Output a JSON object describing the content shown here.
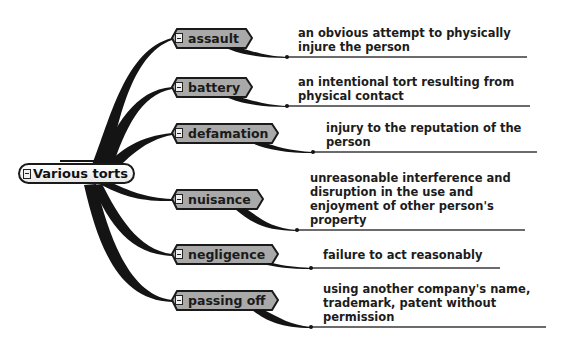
{
  "diagram": {
    "type": "mind-map",
    "root": {
      "label": "Various torts",
      "icon": "collapse-minus-icon"
    },
    "branches": [
      {
        "label": "assault",
        "icon": "collapse-minus-icon",
        "definition": "an obvious attempt to physically injure the person",
        "definition_lines": [
          "an obvious attempt to physically",
          "injure the person"
        ]
      },
      {
        "label": "battery",
        "icon": "collapse-minus-icon",
        "definition": "an intentional tort resulting from physical contact",
        "definition_lines": [
          "an intentional tort resulting from",
          "physical contact"
        ]
      },
      {
        "label": "defamation",
        "icon": "collapse-minus-icon",
        "definition": "injury to the reputation of the person",
        "definition_lines": [
          "injury to the reputation of the",
          "person"
        ]
      },
      {
        "label": "nuisance",
        "icon": "collapse-minus-icon",
        "definition": "unreasonable interference and disruption in the use and enjoyment of other person's property",
        "definition_lines": [
          "unreasonable interference and",
          "disruption in the use and",
          "enjoyment of other person's",
          "property"
        ]
      },
      {
        "label": "negligence",
        "icon": "collapse-minus-icon",
        "definition": "failure to act reasonably",
        "definition_lines": [
          "failure to act reasonably"
        ]
      },
      {
        "label": "passing off",
        "icon": "collapse-minus-icon",
        "definition": "using another company's name, trademark, patent without permission",
        "definition_lines": [
          "using another company's name,",
          "trademark, patent without",
          "permission"
        ]
      }
    ],
    "colors": {
      "branch": "#141414",
      "node_fill": "#a9a9a9",
      "node_border": "#1a1a1a",
      "root_fill": "#f4f4f4",
      "underline": "#3a3a3a",
      "text": "#1a1a1a"
    }
  }
}
